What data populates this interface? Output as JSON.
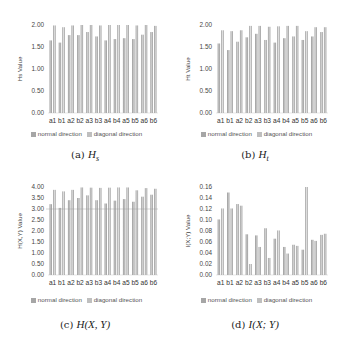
{
  "colors": {
    "normal": "#a6a6a6",
    "diagonal": "#bfbfbf",
    "bar_edge": "#8c8c8c",
    "axis": "#d9d9d9"
  },
  "legend": {
    "normal": "normal direction",
    "diagonal": "diagonal direction"
  },
  "captions": [
    {
      "prefix": "(a)",
      "math": "H",
      "sub": "s"
    },
    {
      "prefix": "(b)",
      "math": "H",
      "sub": "t"
    },
    {
      "prefix": "(c)",
      "math": "H(X, Y)",
      "sub": ""
    },
    {
      "prefix": "(d)",
      "math": "I(X; Y)",
      "sub": ""
    }
  ],
  "chart_data": [
    {
      "type": "bar",
      "title": "(a) Hs",
      "xlabel": "",
      "ylabel": "Hs Value",
      "ylim": [
        0,
        2
      ],
      "yticks": [
        "0.00",
        "0.50",
        "1.00",
        "1.50",
        "2.00"
      ],
      "ytick_values": [
        0,
        0.5,
        1,
        1.5,
        2
      ],
      "grid": false,
      "legend_position": "bottom",
      "categories": [
        "a1",
        "b1",
        "a2",
        "b2",
        "a3",
        "b3",
        "a4",
        "b4",
        "a5",
        "b5",
        "a6",
        "b6"
      ],
      "series": [
        {
          "name": "normal direction",
          "values": [
            1.65,
            1.6,
            1.77,
            1.77,
            1.84,
            1.74,
            1.65,
            1.68,
            1.7,
            1.68,
            1.78,
            1.84
          ]
        },
        {
          "name": "diagonal direction",
          "values": [
            1.99,
            1.95,
            1.99,
            2.0,
            2.0,
            1.99,
            2.0,
            2.0,
            2.0,
            1.99,
            2.0,
            1.98
          ]
        }
      ]
    },
    {
      "type": "bar",
      "title": "(b) Ht",
      "xlabel": "",
      "ylabel": "Ht Value",
      "ylim": [
        0,
        2
      ],
      "yticks": [
        "0.00",
        "0.50",
        "1.00",
        "1.50",
        "2.00"
      ],
      "ytick_values": [
        0,
        0.5,
        1,
        1.5,
        2
      ],
      "grid": false,
      "legend_position": "bottom",
      "categories": [
        "a1",
        "b1",
        "a2",
        "b2",
        "a3",
        "b3",
        "a4",
        "b4",
        "a5",
        "b5",
        "a6",
        "b6"
      ],
      "series": [
        {
          "name": "normal direction",
          "values": [
            1.58,
            1.43,
            1.62,
            1.72,
            1.8,
            1.66,
            1.6,
            1.7,
            1.74,
            1.66,
            1.74,
            1.84
          ]
        },
        {
          "name": "diagonal direction",
          "values": [
            1.88,
            1.86,
            1.88,
            1.98,
            1.98,
            1.96,
            1.97,
            1.98,
            1.98,
            1.86,
            1.95,
            1.95
          ]
        }
      ]
    },
    {
      "type": "bar",
      "title": "(c) H(X,Y)",
      "xlabel": "",
      "ylabel": "H(X,Y) Value",
      "ylim": [
        0,
        4
      ],
      "yticks": [
        "0.00",
        "0.50",
        "1.00",
        "1.50",
        "2.00",
        "2.50",
        "3.00",
        "3.50",
        "4.00"
      ],
      "ytick_values": [
        0,
        0.5,
        1,
        1.5,
        2,
        2.5,
        3,
        3.5,
        4
      ],
      "grid": false,
      "legend_position": "bottom",
      "categories": [
        "a1",
        "b1",
        "a2",
        "b2",
        "a3",
        "b3",
        "a4",
        "b4",
        "a5",
        "b5",
        "a6",
        "b6"
      ],
      "series": [
        {
          "name": "normal direction",
          "values": [
            3.22,
            3.05,
            3.4,
            3.5,
            3.62,
            3.4,
            3.25,
            3.38,
            3.45,
            3.33,
            3.56,
            3.65
          ]
        },
        {
          "name": "diagonal direction",
          "values": [
            3.87,
            3.8,
            3.87,
            3.98,
            3.97,
            3.96,
            3.97,
            3.98,
            3.98,
            3.85,
            3.95,
            3.92
          ]
        }
      ]
    },
    {
      "type": "bar",
      "title": "(d) I(X;Y)",
      "xlabel": "",
      "ylabel": "I(X;Y) Value",
      "ylim": [
        0,
        0.16
      ],
      "yticks": [
        "0.00",
        "0.02",
        "0.04",
        "0.06",
        "0.08",
        "0.10",
        "0.12",
        "0.14",
        "0.16"
      ],
      "ytick_values": [
        0,
        0.02,
        0.04,
        0.06,
        0.08,
        0.1,
        0.12,
        0.14,
        0.16
      ],
      "grid": false,
      "legend_position": "bottom",
      "categories": [
        "a1",
        "b1",
        "a2",
        "b2",
        "a3",
        "b3",
        "a4",
        "b4",
        "a5",
        "b5",
        "a6",
        "b6"
      ],
      "series": [
        {
          "name": "normal direction",
          "values": [
            0.101,
            0.15,
            0.129,
            0.074,
            0.072,
            0.085,
            0.066,
            0.051,
            0.055,
            0.046,
            0.064,
            0.073
          ]
        },
        {
          "name": "diagonal direction",
          "values": [
            0.121,
            0.121,
            0.126,
            0.02,
            0.051,
            0.031,
            0.081,
            0.039,
            0.053,
            0.16,
            0.062,
            0.075
          ]
        }
      ]
    }
  ]
}
